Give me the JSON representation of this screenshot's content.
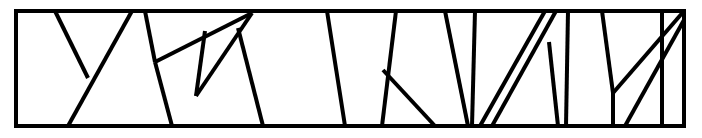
{
  "figure": {
    "name": "partitioned-rectangle-line-drawing",
    "type": "geometric-line-diagram",
    "canvas": {
      "width": 702,
      "height": 138
    },
    "background_color": "#ffffff",
    "stroke_color": "#000000",
    "frame": {
      "name": "outer-rectangle",
      "x": 16,
      "y": 11,
      "width": 668,
      "height": 115,
      "stroke_width": 4,
      "path": "M 16 11 L 684 11 L 684 126 L 16 126 Z"
    },
    "segments": [
      {
        "name": "segment-y-left-arm",
        "stroke_width": 4,
        "points": [
          [
            55,
            11
          ],
          [
            88,
            78
          ]
        ],
        "path": "M 55 11 L 88 78"
      },
      {
        "name": "segment-y-stem-right",
        "stroke_width": 4,
        "points": [
          [
            132,
            11
          ],
          [
            68,
            126
          ]
        ],
        "path": "M 132 11 L 68 126"
      },
      {
        "name": "segment-left-cell-divider",
        "stroke_width": 4,
        "points": [
          [
            145,
            11
          ],
          [
            155,
            62
          ]
        ],
        "path": "M 145 11 L 155 62"
      },
      {
        "name": "segment-descender-to-base-left",
        "stroke_width": 4,
        "points": [
          [
            155,
            62
          ],
          [
            172,
            126
          ]
        ],
        "path": "M 155 62 L 172 126"
      },
      {
        "name": "segment-rising-diagonal-long",
        "stroke_width": 4,
        "points": [
          [
            155,
            62
          ],
          [
            252,
            13
          ]
        ],
        "path": "M 155 62 L 252 13"
      },
      {
        "name": "segment-mid-left-slanted-divider",
        "stroke_width": 4,
        "points": [
          [
            238,
            28
          ],
          [
            263,
            126
          ]
        ],
        "path": "M 238 28 L 263 126"
      },
      {
        "name": "segment-mid-rising-diagonal",
        "stroke_width": 4,
        "points": [
          [
            196,
            96
          ],
          [
            252,
            13
          ]
        ],
        "path": "M 196 96 L 252 13"
      },
      {
        "name": "segment-mid-left-vertical",
        "stroke_width": 4,
        "points": [
          [
            205,
            31
          ],
          [
            196,
            96
          ]
        ],
        "path": "M 205 31 L 196 96"
      },
      {
        "name": "segment-center-divider-a",
        "stroke_width": 4,
        "points": [
          [
            327,
            11
          ],
          [
            345,
            126
          ]
        ],
        "path": "M 327 11 L 345 126"
      },
      {
        "name": "segment-center-divider-b",
        "stroke_width": 4,
        "points": [
          [
            396,
            11
          ],
          [
            382,
            126
          ]
        ],
        "path": "M 396 11 L 382 126"
      },
      {
        "name": "segment-triangle-hypotenuse",
        "stroke_width": 4,
        "points": [
          [
            383,
            70
          ],
          [
            435,
            126
          ]
        ],
        "path": "M 383 70 L 435 126"
      },
      {
        "name": "segment-right-cell-wall-a",
        "stroke_width": 4,
        "points": [
          [
            445,
            11
          ],
          [
            468,
            126
          ]
        ],
        "path": "M 445 11 L 468 126"
      },
      {
        "name": "segment-right-cell-wall-b",
        "stroke_width": 4,
        "points": [
          [
            475,
            11
          ],
          [
            472,
            126
          ]
        ],
        "path": "M 475 11 L 472 126"
      },
      {
        "name": "segment-narrow-sliver-left",
        "stroke_width": 4,
        "points": [
          [
            480,
            126
          ],
          [
            545,
            11
          ]
        ],
        "path": "M 480 126 L 545 11"
      },
      {
        "name": "segment-narrow-sliver-right",
        "stroke_width": 4,
        "points": [
          [
            492,
            126
          ],
          [
            556,
            11
          ]
        ],
        "path": "M 492 126 L 556 11"
      },
      {
        "name": "segment-right-branch-vertex",
        "stroke_width": 4,
        "points": [
          [
            549,
            42
          ],
          [
            558,
            126
          ]
        ],
        "path": "M 549 42 L 558 126"
      },
      {
        "name": "segment-right-cell-wall-c",
        "stroke_width": 4,
        "points": [
          [
            568,
            11
          ],
          [
            566,
            126
          ]
        ],
        "path": "M 568 11 L 566 126"
      },
      {
        "name": "segment-right-cell-wall-d",
        "stroke_width": 4,
        "points": [
          [
            602,
            11
          ],
          [
            613,
            93
          ]
        ],
        "path": "M 602 11 L 613 93"
      },
      {
        "name": "segment-v-right-arm",
        "stroke_width": 4,
        "points": [
          [
            613,
            93
          ],
          [
            684,
            11
          ]
        ],
        "path": "M 613 93 L 684 11"
      },
      {
        "name": "segment-v-foot",
        "stroke_width": 4,
        "points": [
          [
            613,
            93
          ],
          [
            613,
            126
          ]
        ],
        "path": "M 613 93 L 613 126"
      },
      {
        "name": "segment-far-right-diagonal",
        "stroke_width": 4,
        "points": [
          [
            625,
            126
          ],
          [
            684,
            20
          ]
        ],
        "path": "M 625 126 L 684 20"
      },
      {
        "name": "segment-far-right-wall",
        "stroke_width": 4,
        "points": [
          [
            662,
            11
          ],
          [
            662,
            126
          ]
        ],
        "path": "M 662 11 L 662 126"
      }
    ]
  }
}
